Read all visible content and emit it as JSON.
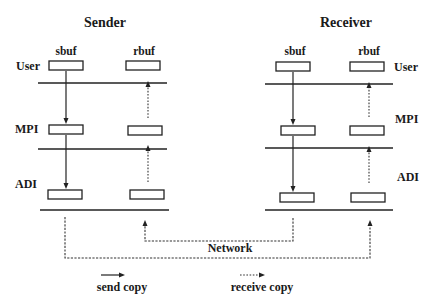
{
  "diagram": {
    "sender": {
      "title": "Sender",
      "buffers": {
        "send": "sbuf",
        "receive": "rbuf"
      },
      "layers": {
        "user": "User",
        "mpi": "MPI",
        "adi": "ADI"
      }
    },
    "receiver": {
      "title": "Receiver",
      "buffers": {
        "send": "sbuf",
        "receive": "rbuf"
      },
      "layers": {
        "user": "User",
        "mpi": "MPI",
        "adi": "ADI"
      }
    },
    "network": {
      "label": "Network"
    },
    "legend": {
      "send_copy": "send copy",
      "receive_copy": "receive copy"
    },
    "colors": {
      "line": "#222222",
      "background": "#ffffff"
    }
  }
}
